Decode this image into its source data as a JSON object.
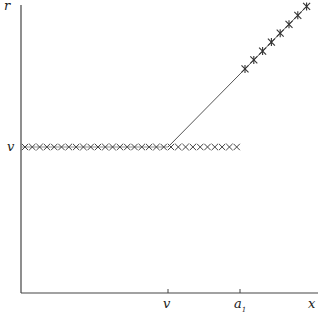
{
  "chart_data": {
    "type": "line",
    "title": "",
    "xlabel": "x",
    "ylabel": "r",
    "x_ticks": [
      "v",
      "a1"
    ],
    "y_ticks": [
      "v"
    ],
    "series": [
      {
        "name": "flat segment r = v (x marks)",
        "marker": "x",
        "points_x_px": [
          22,
          240
        ],
        "y_label": "v"
      },
      {
        "name": "rising segment r = x for x > v",
        "marker": "*",
        "from": "v",
        "to": "x-max"
      }
    ],
    "grid": false
  },
  "labels": {
    "y_axis": "r",
    "x_axis": "x",
    "y_tick_v": "v",
    "x_tick_v": "v",
    "x_tick_a1": "a",
    "x_tick_a1_sub": "1"
  },
  "colors": {
    "ink": "#333333",
    "background": "#ffffff"
  }
}
